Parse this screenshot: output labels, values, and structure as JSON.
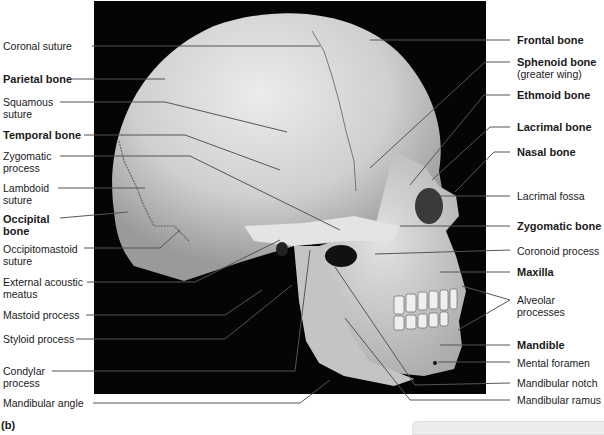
{
  "figure": {
    "part_label": "(b)",
    "colors": {
      "background": "#ffffff",
      "photo_background": "#050505",
      "bone": "#d6d6d6",
      "leader_line": "#555555",
      "text": "#1a1a1a"
    }
  },
  "left_labels": [
    {
      "text": "Coronal suture",
      "bold": false
    },
    {
      "text": "Parietal bone",
      "bold": true
    },
    {
      "text": "Squamous",
      "line2": "suture",
      "bold": false
    },
    {
      "text": "Temporal bone",
      "bold": true
    },
    {
      "text": "Zygomatic",
      "line2": "process",
      "bold": false
    },
    {
      "text": "Lambdoid",
      "line2": "suture",
      "bold": false
    },
    {
      "text": "Occipital",
      "line2": "bone",
      "bold": true
    },
    {
      "text": "Occipitomastoid",
      "line2": "suture",
      "bold": false
    },
    {
      "text": "External acoustic",
      "line2": "meatus",
      "bold": false
    },
    {
      "text": "Mastoid process",
      "bold": false
    },
    {
      "text": "Styloid process",
      "bold": false
    },
    {
      "text": "Condylar",
      "line2": "process",
      "bold": false
    },
    {
      "text": "Mandibular angle",
      "bold": false
    }
  ],
  "right_labels": [
    {
      "text": "Frontal bone",
      "bold": true
    },
    {
      "text": "Sphenoid bone",
      "line2": "(greater wing)",
      "bold": true
    },
    {
      "text": "Ethmoid bone",
      "bold": true
    },
    {
      "text": "Lacrimal bone",
      "bold": true
    },
    {
      "text": "Nasal bone",
      "bold": true
    },
    {
      "text": "Lacrimal fossa",
      "bold": false
    },
    {
      "text": "Zygomatic bone",
      "bold": true
    },
    {
      "text": "Coronoid process",
      "bold": false
    },
    {
      "text": "Maxilla",
      "bold": true
    },
    {
      "text": "Alveolar",
      "line2": "processes",
      "bold": false
    },
    {
      "text": "Mandible",
      "bold": true
    },
    {
      "text": "Mental foramen",
      "bold": false
    },
    {
      "text": "Mandibular notch",
      "bold": false
    },
    {
      "text": "Mandibular ramus",
      "bold": false
    }
  ]
}
